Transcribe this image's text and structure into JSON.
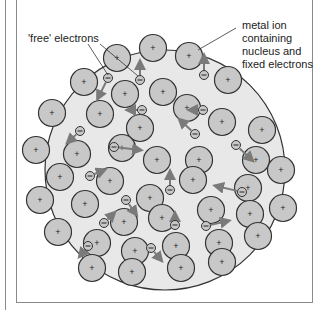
{
  "diagram": {
    "labels": {
      "free_electrons": "'free' electrons",
      "metal_ion_line1": "metal ion",
      "metal_ion_line2": "containing",
      "metal_ion_line3": "nucleus and",
      "metal_ion_line4": "fixed electrons"
    },
    "ion_symbol": "+",
    "electron_symbol": "−",
    "colors": {
      "lattice_fill": "#e8e8e8",
      "ion_fill": "#c8c8c8",
      "outline": "#333333",
      "arrow": "#7a7a7a",
      "frame": "#8a8a8a"
    },
    "lattice": {
      "cx": 165,
      "cy": 170,
      "r": 120
    },
    "ion_radius": 13.5,
    "ions": [
      [
        117,
        58
      ],
      [
        153,
        48
      ],
      [
        189,
        56
      ],
      [
        84,
        82
      ],
      [
        125,
        94
      ],
      [
        163,
        92
      ],
      [
        228,
        80
      ],
      [
        52,
        113
      ],
      [
        100,
        114
      ],
      [
        140,
        128
      ],
      [
        187,
        108
      ],
      [
        222,
        122
      ],
      [
        262,
        130
      ],
      [
        36,
        150
      ],
      [
        77,
        154
      ],
      [
        122,
        148
      ],
      [
        157,
        160
      ],
      [
        199,
        160
      ],
      [
        256,
        160
      ],
      [
        60,
        177
      ],
      [
        110,
        181
      ],
      [
        150,
        198
      ],
      [
        193,
        180
      ],
      [
        248,
        188
      ],
      [
        281,
        170
      ],
      [
        40,
        200
      ],
      [
        85,
        204
      ],
      [
        124,
        222
      ],
      [
        162,
        218
      ],
      [
        211,
        210
      ],
      [
        250,
        214
      ],
      [
        283,
        208
      ],
      [
        58,
        232
      ],
      [
        97,
        243
      ],
      [
        135,
        251
      ],
      [
        176,
        246
      ],
      [
        219,
        243
      ],
      [
        258,
        236
      ],
      [
        92,
        268
      ],
      [
        132,
        272
      ],
      [
        181,
        268
      ],
      [
        222,
        262
      ]
    ],
    "electrons": [
      {
        "x": 108,
        "y": 78,
        "ax": 98,
        "ay": 98
      },
      {
        "x": 140,
        "y": 80,
        "ax": 140,
        "ay": 62
      },
      {
        "x": 203,
        "y": 110,
        "ax": 190,
        "ay": 110
      },
      {
        "x": 204,
        "y": 75,
        "ax": 204,
        "ay": 56
      },
      {
        "x": 142,
        "y": 110,
        "ax": 128,
        "ay": 110
      },
      {
        "x": 195,
        "y": 134,
        "ax": 180,
        "ay": 120
      },
      {
        "x": 80,
        "y": 131,
        "ax": 68,
        "ay": 142
      },
      {
        "x": 114,
        "y": 147,
        "ax": 140,
        "ay": 150
      },
      {
        "x": 90,
        "y": 176,
        "ax": 104,
        "ay": 170
      },
      {
        "x": 236,
        "y": 145,
        "ax": 252,
        "ay": 160
      },
      {
        "x": 170,
        "y": 190,
        "ax": 170,
        "ay": 172
      },
      {
        "x": 242,
        "y": 192,
        "ax": 216,
        "ay": 186
      },
      {
        "x": 126,
        "y": 200,
        "ax": 136,
        "ay": 214
      },
      {
        "x": 104,
        "y": 223,
        "ax": 114,
        "ay": 213
      },
      {
        "x": 88,
        "y": 246,
        "ax": 80,
        "ay": 256
      },
      {
        "x": 175,
        "y": 225,
        "ax": 175,
        "ay": 214
      },
      {
        "x": 206,
        "y": 226,
        "ax": 228,
        "ay": 221
      },
      {
        "x": 151,
        "y": 248,
        "ax": 161,
        "ay": 260
      }
    ],
    "leaders": [
      {
        "x1": 88,
        "y1": 44,
        "x2": 108,
        "y2": 75
      },
      {
        "x1": 100,
        "y1": 44,
        "x2": 138,
        "y2": 76
      },
      {
        "x1": 236,
        "y1": 28,
        "x2": 198,
        "y2": 50
      }
    ]
  }
}
